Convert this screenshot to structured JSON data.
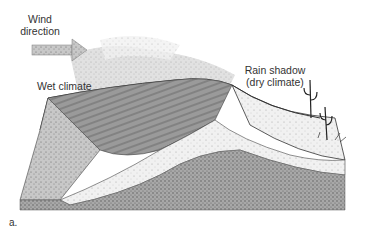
{
  "figure": {
    "panel_label": "a.",
    "labels": {
      "wind_direction": [
        "Wind",
        "direction"
      ],
      "wet_climate": "Wet climate",
      "rain_shadow": [
        "Rain shadow",
        "(dry climate)"
      ]
    },
    "icons": {
      "wind_arrow": "wind-arrow-icon",
      "cactus": "cactus-icon"
    },
    "colors": {
      "ink": "#333333",
      "shade_dark": "#8a8a8a",
      "shade_mid": "#b5b5b5",
      "shade_light": "#dcdcdc",
      "background": "#ffffff"
    }
  }
}
